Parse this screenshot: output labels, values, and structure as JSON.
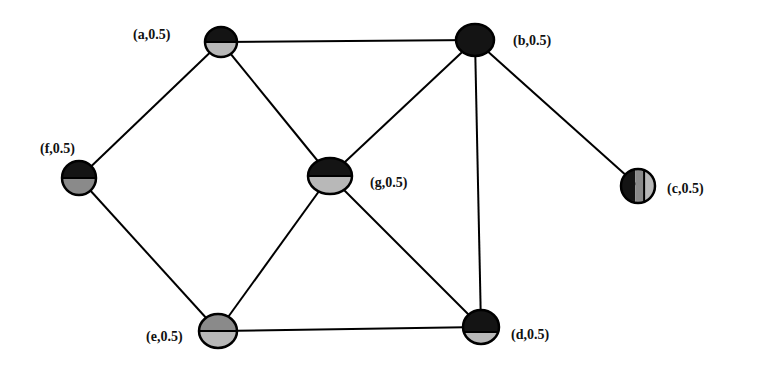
{
  "diagram": {
    "type": "graph",
    "colors": {
      "dark": "#141414",
      "medium": "#8a8a8a",
      "light": "#b8b8b8",
      "edge": "#000000"
    },
    "nodes": [
      {
        "id": "a",
        "label": "(a,0.5)",
        "cx": 221,
        "cy": 42,
        "rx": 16,
        "ry": 15,
        "style": "h-split",
        "top": "dark",
        "bottom": "light",
        "split": 0.5,
        "label_x": 133,
        "label_y": 28
      },
      {
        "id": "b",
        "label": "(b,0.5)",
        "cx": 475,
        "cy": 40,
        "rx": 19,
        "ry": 16,
        "style": "solid",
        "fill": "dark",
        "label_x": 513,
        "label_y": 34
      },
      {
        "id": "c",
        "label": "(c,0.5)",
        "cx": 638,
        "cy": 186,
        "rx": 17,
        "ry": 17,
        "style": "v-stripes",
        "label_x": 667,
        "label_y": 182
      },
      {
        "id": "d",
        "label": "(d,0.5)",
        "cx": 481,
        "cy": 327,
        "rx": 18,
        "ry": 17,
        "style": "h-split",
        "top": "dark",
        "bottom": "light",
        "split": 0.65,
        "label_x": 511,
        "label_y": 328
      },
      {
        "id": "e",
        "label": "(e,0.5)",
        "cx": 218,
        "cy": 331,
        "rx": 19,
        "ry": 17,
        "style": "h-split",
        "top": "medium",
        "bottom": "light",
        "split": 0.5,
        "label_x": 146,
        "label_y": 330
      },
      {
        "id": "f",
        "label": "(f,0.5)",
        "cx": 79,
        "cy": 178,
        "rx": 17,
        "ry": 17,
        "style": "h-split",
        "top": "dark",
        "bottom": "medium",
        "split": 0.5,
        "label_x": 40,
        "label_y": 142
      },
      {
        "id": "g",
        "label": "(g,0.5)",
        "cx": 330,
        "cy": 176,
        "rx": 22,
        "ry": 18,
        "style": "h-split",
        "top": "dark",
        "bottom": "light",
        "split": 0.5,
        "label_x": 370,
        "label_y": 176
      }
    ],
    "edges": [
      [
        "a",
        "b"
      ],
      [
        "a",
        "f"
      ],
      [
        "a",
        "g"
      ],
      [
        "b",
        "g"
      ],
      [
        "b",
        "c"
      ],
      [
        "b",
        "d"
      ],
      [
        "f",
        "e"
      ],
      [
        "g",
        "e"
      ],
      [
        "g",
        "d"
      ],
      [
        "e",
        "d"
      ]
    ]
  }
}
